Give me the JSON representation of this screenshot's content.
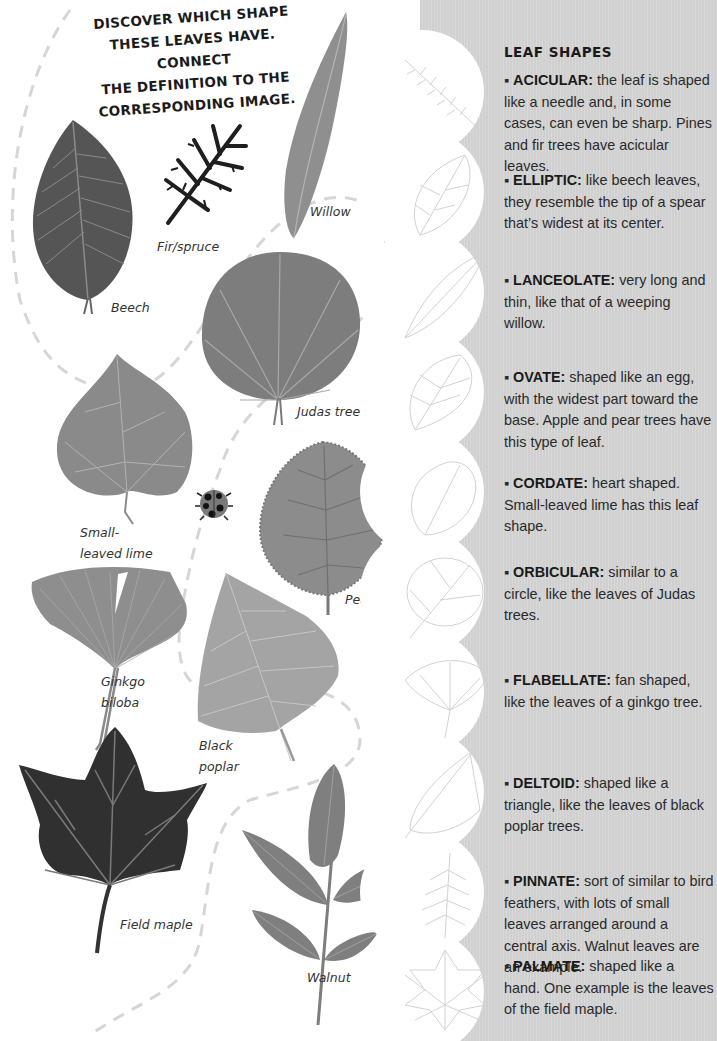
{
  "activity": {
    "instruction_lines": [
      "DISCOVER WHICH SHAPE",
      "THESE LEAVES HAVE. CONNECT",
      "THE DEFINITION TO THE",
      "CORRESPONDING IMAGE."
    ],
    "leaves": [
      {
        "name": "Beech",
        "label": "Beech"
      },
      {
        "name": "Fir/spruce",
        "label": "Fir/spruce"
      },
      {
        "name": "Willow",
        "label": "Willow"
      },
      {
        "name": "Judas tree",
        "label": "Judas tree"
      },
      {
        "name": "Small-leaved lime",
        "label_line1": "Small-",
        "label_line2": "leaved lime"
      },
      {
        "name": "Pear",
        "label": "Pear"
      },
      {
        "name": "Ginkgo biloba",
        "label_line1": "Ginkgo",
        "label_line2": "biloba"
      },
      {
        "name": "Black poplar",
        "label_line1": "Black",
        "label_line2": "poplar"
      },
      {
        "name": "Field maple",
        "label": "Field maple"
      },
      {
        "name": "Walnut",
        "label": "Walnut"
      }
    ]
  },
  "leaf_shapes": {
    "title": "LEAF SHAPES",
    "definitions": [
      {
        "term": "ACICULAR:",
        "text": " the leaf is shaped like a needle and, in some cases, can even be sharp. Pines and fir trees have acicular leaves."
      },
      {
        "term": "ELLIPTIC:",
        "text": "like beech leaves, they resemble the tip of a spear that’s widest at its center."
      },
      {
        "term": "LANCEOLATE:",
        "text": "very long and thin, like that of a weeping willow."
      },
      {
        "term": "OVATE:",
        "text": "shaped like an egg, with the widest part toward the base. Apple and pear trees have this type of leaf."
      },
      {
        "term": "CORDATE:",
        "text": "heart shaped. Small-leaved lime has this leaf shape."
      },
      {
        "term": "ORBICULAR:",
        "text": "similar to a circle, like the leaves of Judas trees."
      },
      {
        "term": "FLABELLATE:",
        "text": "fan shaped, like the leaves of a ginkgo tree."
      },
      {
        "term": "DELTOID:",
        "text": "shaped like a triangle, like the leaves of black poplar trees."
      },
      {
        "term": "PINNATE:",
        "text": "sort of similar to bird feathers, with lots of small leaves arranged around a central axis. Walnut leaves are an example."
      },
      {
        "term": "PALMATE:",
        "text": "shaped like a hand. One example is the leaves of the field maple."
      }
    ],
    "bullet": "▪"
  },
  "colors": {
    "panel_gray": "#d3d3d3",
    "dashed_path": "#d6d6d6",
    "leaf_dark": "#3c3c3c",
    "leaf_mid": "#7d7d7d",
    "leaf_light": "#9a9a9a",
    "text": "#1a1a1a"
  }
}
